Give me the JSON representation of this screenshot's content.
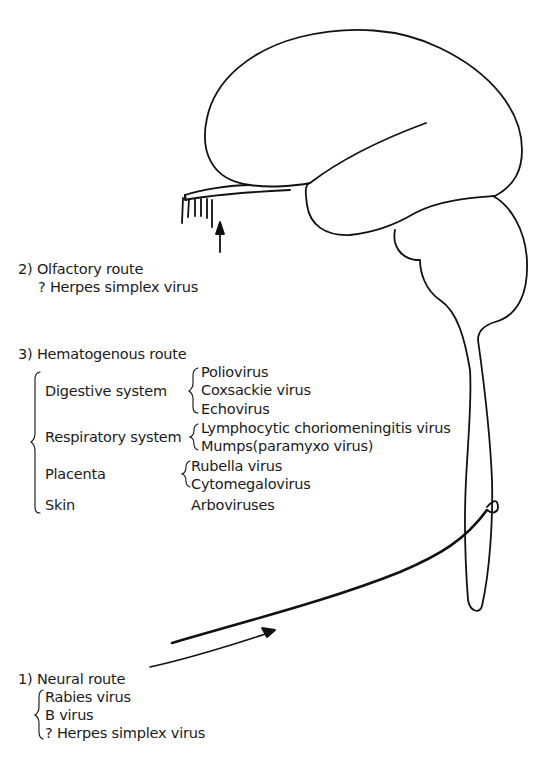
{
  "diagram": {
    "routes": {
      "neural": {
        "title": "1) Neural route",
        "viruses": [
          "Rabies virus",
          "B virus",
          "? Herpes simplex virus"
        ]
      },
      "olfactory": {
        "title": "2) Olfactory route",
        "viruses": [
          "? Herpes simplex virus"
        ]
      },
      "hematogenous": {
        "title": "3) Hematogenous route",
        "systems": [
          {
            "name": "Digestive system",
            "viruses": [
              "Poliovirus",
              "Coxsackie virus",
              "Echovirus"
            ]
          },
          {
            "name": "Respiratory system",
            "viruses": [
              "Lymphocytic choriomeningitis virus",
              "Mumps(paramyxo virus)"
            ]
          },
          {
            "name": "Placenta",
            "viruses": [
              "Rubella virus",
              "Cytomegalovirus"
            ]
          },
          {
            "name": "Skin",
            "viruses": [
              "Arboviruses"
            ]
          }
        ]
      }
    },
    "anatomy": [
      "cerebrum",
      "olfactory bulb",
      "brainstem",
      "cerebellum",
      "spinal cord",
      "peripheral nerve"
    ],
    "colors": {
      "line": "#111111",
      "background": "#ffffff"
    }
  }
}
